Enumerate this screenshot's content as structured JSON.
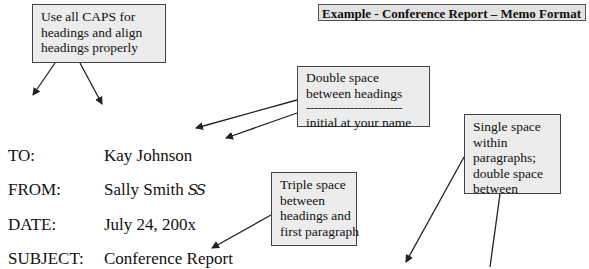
{
  "title": "Example - Conference Report – Memo Format",
  "callouts": {
    "caps": [
      "Use all CAPS for",
      "headings and align",
      "headings properly"
    ],
    "double_space": {
      "lines": [
        "Double space",
        "between headings"
      ],
      "divider": "------------------------",
      "note": "initial at your name"
    },
    "single_space": [
      "Single space",
      "within",
      "paragraphs;",
      "double space",
      "between"
    ],
    "triple_space": [
      "Triple space",
      "between",
      "headings and",
      "first paragraph"
    ]
  },
  "memo": {
    "to": {
      "label": "TO:",
      "value": "Kay Johnson"
    },
    "from": {
      "label": "FROM:",
      "value": "Sally Smith",
      "initials": "SS"
    },
    "date": {
      "label": "DATE:",
      "value": "July 24, 200x"
    },
    "subject": {
      "label": "SUBJECT:",
      "value": "Conference Report"
    }
  },
  "colors": {
    "callout_fill": "#ececec",
    "banner_fill": "#e2e2e2",
    "line": "#222222"
  }
}
